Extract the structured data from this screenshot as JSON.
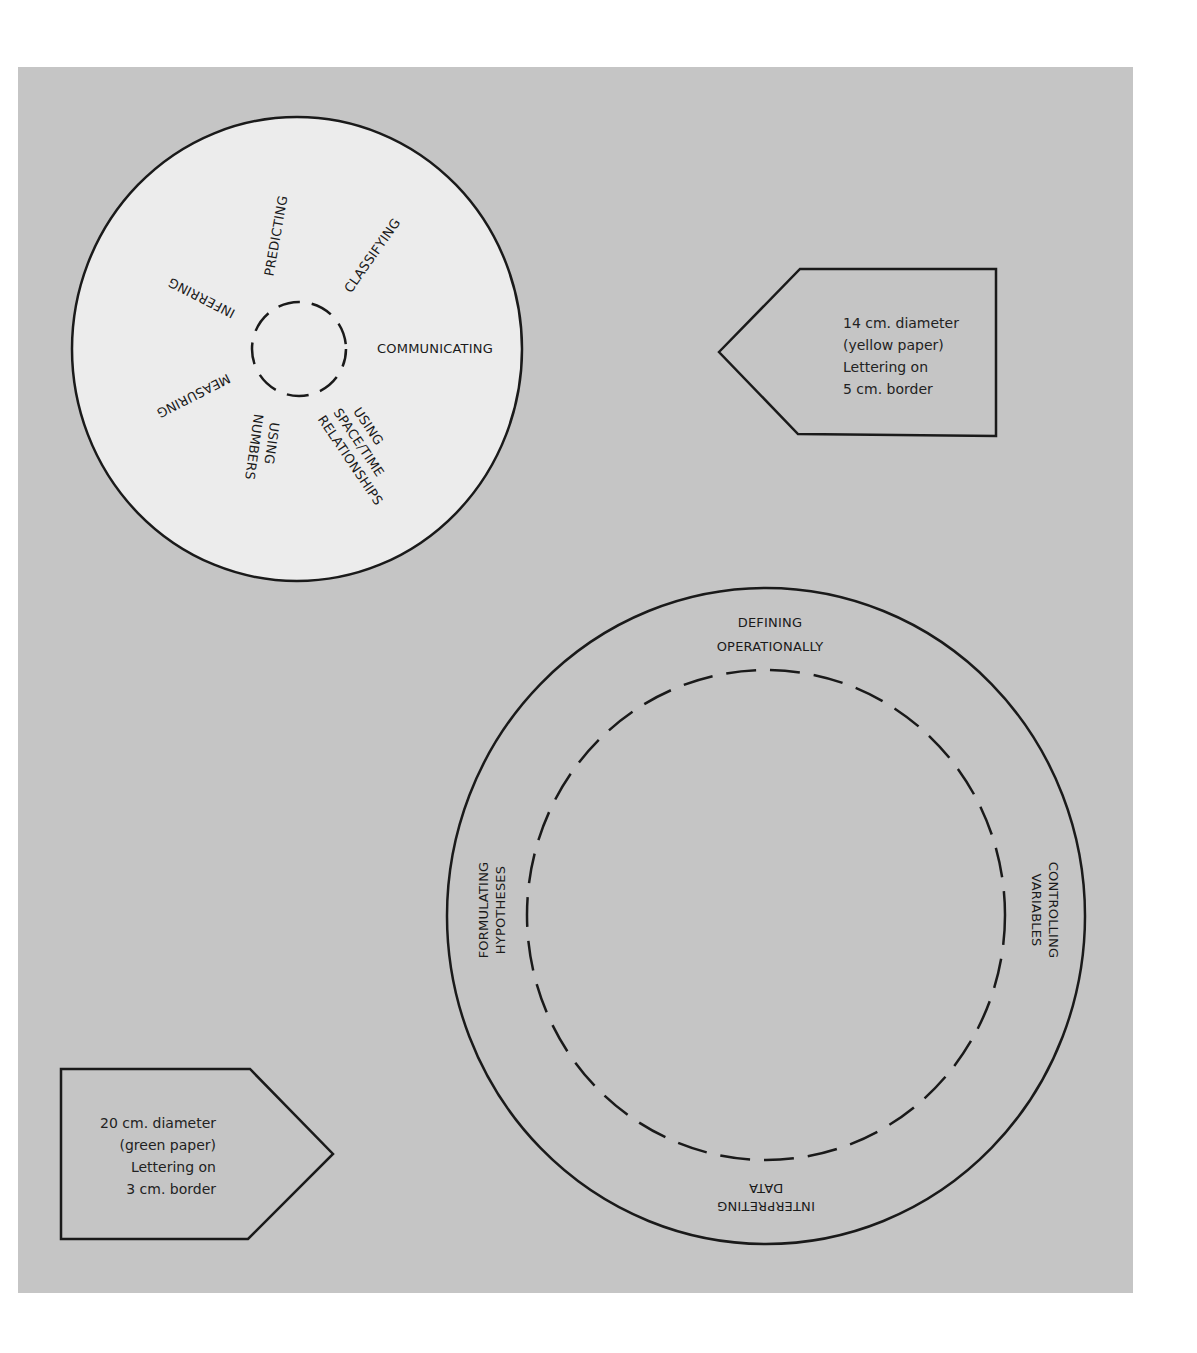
{
  "page": {
    "background": "#ffffff",
    "panel_color": "#c5c5c5",
    "line_color": "#1a1a1a"
  },
  "small_wheel": {
    "fill": "#ececec",
    "label_predicting": "PREDICTING",
    "label_classifying": "CLASSIFYING",
    "label_communicating": "COMMUNICATING",
    "label_space_time_1": "USING",
    "label_space_time_2": "SPACE/TIME",
    "label_space_time_3": "RELATIONSHIPS",
    "label_numbers_1": "USING",
    "label_numbers_2": "NUMBERS",
    "label_measuring": "MEASURING",
    "label_inferring": "INFERRING"
  },
  "small_wheel_note": {
    "line1": "14 cm. diameter",
    "line2": "(yellow paper)",
    "line3": "Lettering on",
    "line4": "5 cm. border"
  },
  "large_wheel": {
    "label_top_1": "DEFINING",
    "label_top_2": "OPERATIONALLY",
    "label_right_1": "CONTROLLING",
    "label_right_2": "VARIABLES",
    "label_bottom_1": "INTERPRETING",
    "label_bottom_2": "DATA",
    "label_left_1": "FORMULATING",
    "label_left_2": "HYPOTHESES"
  },
  "large_wheel_note": {
    "line1": "20 cm. diameter",
    "line2": "(green paper)",
    "line3": "Lettering on",
    "line4": "3 cm. border"
  }
}
